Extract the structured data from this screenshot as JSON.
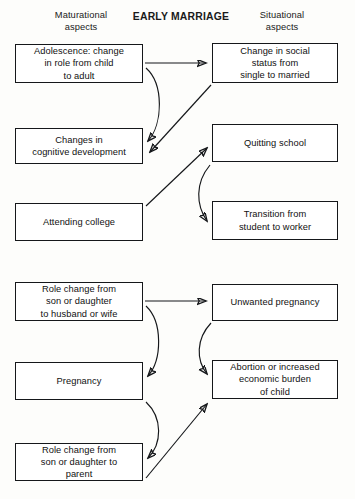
{
  "header": {
    "left_label": "Maturational\naspects",
    "center_title": "EARLY MARRIAGE",
    "right_label": "Situational\naspects"
  },
  "theme": {
    "background": "#fdfdfb",
    "box_fill": "#ffffff",
    "ink": "#15171a",
    "text": "#111111"
  },
  "diagram": {
    "type": "flowchart",
    "columns": [
      "Maturational aspects",
      "Situational aspects"
    ],
    "nodes": [
      {
        "id": "adolescence",
        "column": "left",
        "group": "upper",
        "label": "Adolescence: change\nin role from child\nto adult",
        "x": 15,
        "y": 44,
        "w": 128,
        "h": 39
      },
      {
        "id": "social-status",
        "column": "right",
        "group": "upper",
        "label": "Change in social\nstatus from\nsingle to married",
        "x": 212,
        "y": 43,
        "w": 126,
        "h": 40
      },
      {
        "id": "cognitive",
        "column": "left",
        "group": "upper",
        "label": "Changes in\ncognitive development",
        "x": 15,
        "y": 128,
        "w": 128,
        "h": 36
      },
      {
        "id": "quitting-school",
        "column": "right",
        "group": "upper",
        "label": "Quitting school",
        "x": 212,
        "y": 124,
        "w": 126,
        "h": 38
      },
      {
        "id": "attending-college",
        "column": "left",
        "group": "upper",
        "label": "Attending college",
        "x": 15,
        "y": 203,
        "w": 128,
        "h": 38
      },
      {
        "id": "transition-worker",
        "column": "right",
        "group": "upper",
        "label": "Transition from\nstudent to worker",
        "x": 212,
        "y": 201,
        "w": 126,
        "h": 39
      },
      {
        "id": "role-spouse",
        "column": "left",
        "group": "lower",
        "label": "Role change from\nson or daughter\nto husband or wife",
        "x": 15,
        "y": 282,
        "w": 128,
        "h": 39
      },
      {
        "id": "unwanted-pregnancy",
        "column": "right",
        "group": "lower",
        "label": "Unwanted pregnancy",
        "x": 212,
        "y": 284,
        "w": 126,
        "h": 37
      },
      {
        "id": "pregnancy",
        "column": "left",
        "group": "lower",
        "label": "Pregnancy",
        "x": 15,
        "y": 362,
        "w": 128,
        "h": 38
      },
      {
        "id": "abortion-burden",
        "column": "right",
        "group": "lower",
        "label": "Abortion or increased\neconomic burden\nof child",
        "x": 212,
        "y": 360,
        "w": 126,
        "h": 39
      },
      {
        "id": "role-parent",
        "column": "left",
        "group": "lower",
        "label": "Role change from\nson or daughter to\nparent",
        "x": 15,
        "y": 443,
        "w": 128,
        "h": 38
      }
    ],
    "edges": [
      {
        "id": "e1",
        "from": "adolescence",
        "to": "social-status",
        "style": "straight",
        "d": "M145,63 L206,63"
      },
      {
        "id": "e2",
        "from": "adolescence",
        "to": "cognitive",
        "style": "curved",
        "d": "M146,68 C164,84 163,124 148,141"
      },
      {
        "id": "e3",
        "from": "social-status",
        "to": "cognitive",
        "style": "straight",
        "d": "M211,85 L150,152"
      },
      {
        "id": "e4",
        "from": "attending-college",
        "to": "quitting-school",
        "style": "straight",
        "d": "M146,206 L207,148"
      },
      {
        "id": "e5",
        "from": "quitting-school",
        "to": "transition-worker",
        "style": "curved",
        "d": "M210,165 C195,183 196,205 207,221"
      },
      {
        "id": "e6",
        "from": "role-spouse",
        "to": "unwanted-pregnancy",
        "style": "straight",
        "d": "M145,301 L206,301"
      },
      {
        "id": "e7",
        "from": "role-spouse",
        "to": "pregnancy",
        "style": "curved",
        "d": "M146,306 C163,322 162,360 148,376"
      },
      {
        "id": "e8",
        "from": "unwanted-pregnancy",
        "to": "abortion-burden",
        "style": "curved",
        "d": "M211,323 C196,339 196,360 207,374"
      },
      {
        "id": "e9",
        "from": "pregnancy",
        "to": "role-parent",
        "style": "curved",
        "d": "M146,402 C163,418 162,444 148,458"
      },
      {
        "id": "e10",
        "from": "role-parent",
        "to": "abortion-burden",
        "style": "straight",
        "d": "M146,478 L207,404"
      }
    ]
  }
}
